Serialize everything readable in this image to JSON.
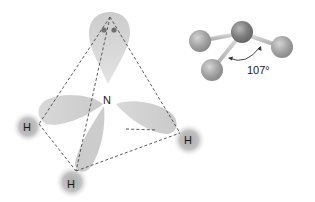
{
  "diagram": {
    "central_atom": {
      "label": "N"
    },
    "hydrogens": [
      {
        "label": "H",
        "position": "left"
      },
      {
        "label": "H",
        "position": "bottom"
      },
      {
        "label": "H",
        "position": "right"
      }
    ],
    "lone_pair": {
      "electrons": 2,
      "position": "top"
    },
    "ball_and_stick": {
      "bond_angle_label": "107°"
    },
    "colors": {
      "orbital_lobe": "#c8c8c8",
      "hydrogen_sphere": "#b0b0b0",
      "dashed_edge": "#4a4a4a",
      "atom_ball": "#9a9a9a",
      "central_ball": "#7c7c7c",
      "electron_dot": "#707070"
    }
  }
}
